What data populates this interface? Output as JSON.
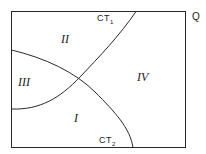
{
  "diagram": {
    "corner_label": "Q",
    "curves": [
      {
        "id": "CT1",
        "label": "CT",
        "subscript": "1"
      },
      {
        "id": "CT2",
        "label": "CT",
        "subscript": "2"
      }
    ],
    "regions": [
      {
        "id": "I",
        "label": "I"
      },
      {
        "id": "II",
        "label": "II"
      },
      {
        "id": "III",
        "label": "III"
      },
      {
        "id": "IV",
        "label": "IV"
      }
    ],
    "colors": {
      "line": "#2a2a2a",
      "background": "#ffffff"
    }
  }
}
